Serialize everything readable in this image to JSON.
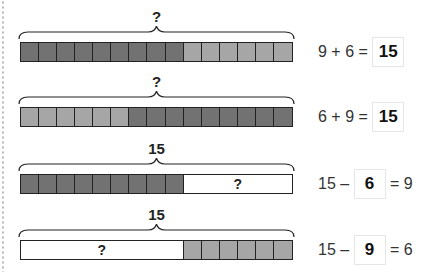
{
  "colors": {
    "dark_cell": "#727272",
    "light_cell": "#a6a6a6",
    "outline": "#222222",
    "background": "#ffffff"
  },
  "rows": [
    {
      "brace_label": "?",
      "segments": [
        {
          "type": "cells",
          "count": 9,
          "shade": "dark"
        },
        {
          "type": "cells",
          "count": 6,
          "shade": "light"
        }
      ],
      "equation": {
        "left": "9 + 6 = ",
        "answer": "15",
        "right": ""
      }
    },
    {
      "brace_label": "?",
      "segments": [
        {
          "type": "cells",
          "count": 6,
          "shade": "light"
        },
        {
          "type": "cells",
          "count": 9,
          "shade": "dark"
        }
      ],
      "equation": {
        "left": "6 + 9 = ",
        "answer": "15",
        "right": ""
      }
    },
    {
      "brace_label": "15",
      "segments": [
        {
          "type": "cells",
          "count": 9,
          "shade": "dark"
        },
        {
          "type": "blank",
          "count": 6,
          "label": "?"
        }
      ],
      "equation": {
        "left": "15 – ",
        "answer": "6",
        "right": " = 9"
      }
    },
    {
      "brace_label": "15",
      "segments": [
        {
          "type": "blank",
          "count": 9,
          "label": "?"
        },
        {
          "type": "cells",
          "count": 6,
          "shade": "light"
        }
      ],
      "equation": {
        "left": "15 – ",
        "answer": "9",
        "right": " = 6"
      }
    }
  ]
}
